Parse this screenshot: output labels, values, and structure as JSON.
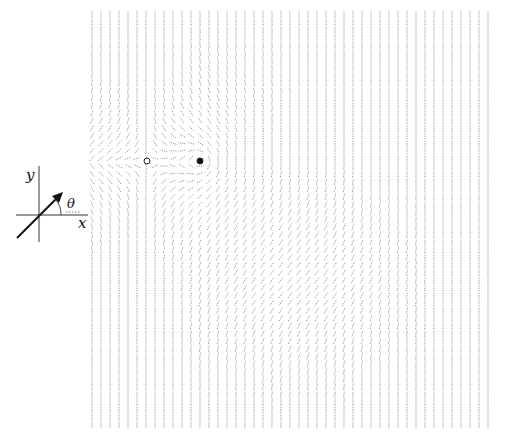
{
  "inset": {
    "y_label": "y",
    "x_label": "x",
    "angle_label": "θ"
  },
  "field": {
    "grid": {
      "x0": 92,
      "x1": 492,
      "y0": 14,
      "y1": 426,
      "dx": 9,
      "dy": 7.6
    },
    "stroke_color": "#8a8a8a",
    "segment_length": 7,
    "defects": [
      {
        "name": "negative-defect",
        "x": 147,
        "y": 161,
        "charge": -1,
        "marker": "open-circle"
      },
      {
        "name": "positive-defect",
        "x": 200,
        "y": 161,
        "charge": 1,
        "marker": "filled-circle"
      }
    ],
    "diagonal_region": {
      "cx": 300,
      "cy": 280,
      "rx": 120,
      "ry": 110,
      "angle_deg": 55
    }
  }
}
